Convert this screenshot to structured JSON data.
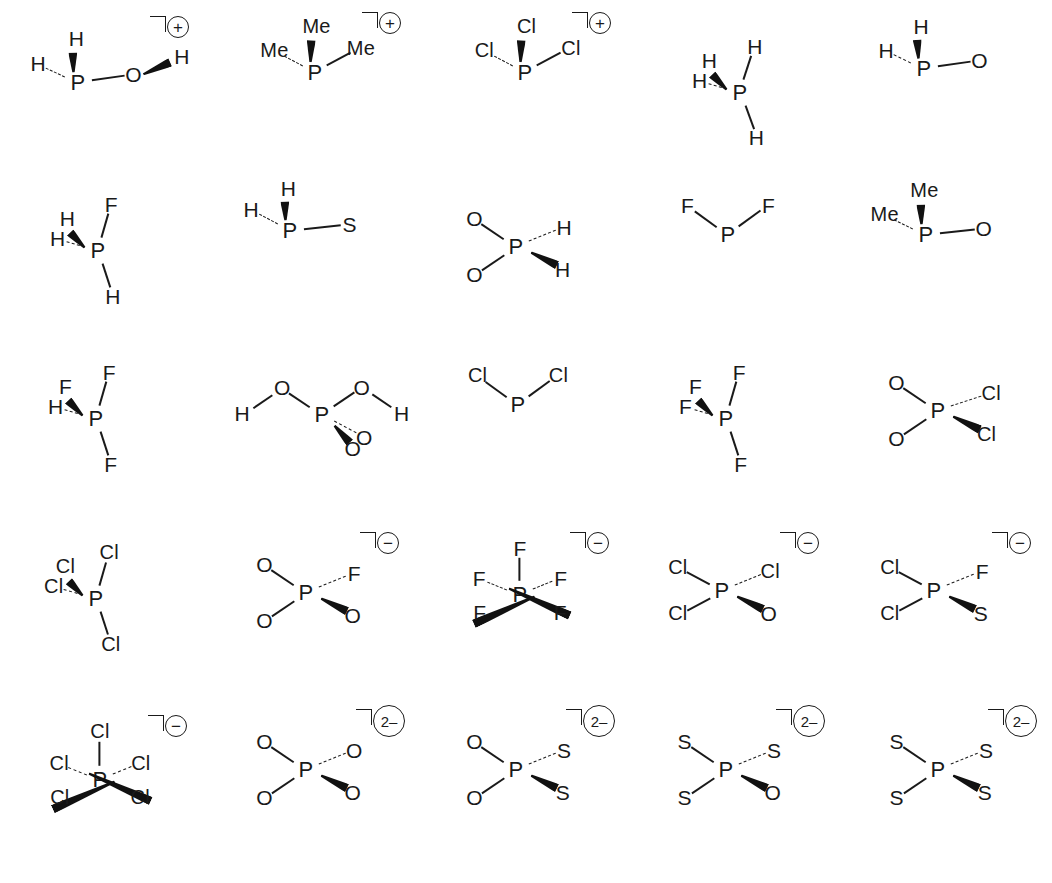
{
  "figure": {
    "columns": 5,
    "rows": 5,
    "background_color": "#ffffff",
    "ink_color": "#1a1a1a"
  },
  "bond_styles": {
    "plain": "plain-line",
    "wedge": "bold-wedge",
    "dash": "hashed-dash"
  },
  "charges": {
    "plus": "+",
    "minus": "−",
    "two_minus": "2–"
  },
  "structures": [
    {
      "id": "s1",
      "center": "P",
      "charge": "+",
      "charge_style": "circle-small",
      "col": 0,
      "row": 0,
      "substituents": [
        {
          "label": "H",
          "bond": "dash"
        },
        {
          "label": "H",
          "bond": "wedge"
        },
        {
          "label": "O",
          "bond": "plain"
        },
        {
          "label": "H",
          "bond": "wedge"
        }
      ]
    },
    {
      "id": "s2",
      "center": "P",
      "charge": "+",
      "charge_style": "circle-small",
      "col": 1,
      "row": 0,
      "substituents": [
        {
          "label": "Me",
          "bond": "dash"
        },
        {
          "label": "Me",
          "bond": "wedge"
        },
        {
          "label": "Me",
          "bond": "plain"
        }
      ]
    },
    {
      "id": "s3",
      "center": "P",
      "charge": "+",
      "charge_style": "circle-small",
      "col": 2,
      "row": 0,
      "substituents": [
        {
          "label": "Cl",
          "bond": "dash"
        },
        {
          "label": "Cl",
          "bond": "wedge"
        },
        {
          "label": "Cl",
          "bond": "plain"
        }
      ]
    },
    {
      "id": "s4",
      "center": "P",
      "charge": "",
      "charge_style": "none",
      "col": 3,
      "row": 0,
      "substituents": [
        {
          "label": "H",
          "bond": "plain"
        },
        {
          "label": "H",
          "bond": "dash"
        },
        {
          "label": "H",
          "bond": "wedge"
        },
        {
          "label": "H",
          "bond": "plain"
        }
      ]
    },
    {
      "id": "s5",
      "center": "P",
      "charge": "",
      "charge_style": "none",
      "col": 4,
      "row": 0,
      "substituents": [
        {
          "label": "H",
          "bond": "dash"
        },
        {
          "label": "H",
          "bond": "wedge"
        },
        {
          "label": "O",
          "bond": "plain"
        }
      ]
    },
    {
      "id": "s6",
      "center": "P",
      "charge": "",
      "charge_style": "none",
      "col": 0,
      "row": 1,
      "substituents": [
        {
          "label": "F",
          "bond": "plain"
        },
        {
          "label": "H",
          "bond": "dash"
        },
        {
          "label": "H",
          "bond": "wedge"
        },
        {
          "label": "H",
          "bond": "plain"
        }
      ]
    },
    {
      "id": "s7",
      "center": "P",
      "charge": "",
      "charge_style": "none",
      "col": 1,
      "row": 1,
      "substituents": [
        {
          "label": "H",
          "bond": "dash"
        },
        {
          "label": "H",
          "bond": "wedge"
        },
        {
          "label": "S",
          "bond": "plain"
        }
      ]
    },
    {
      "id": "s8",
      "center": "P",
      "charge": "",
      "charge_style": "none",
      "col": 2,
      "row": 1,
      "substituents": [
        {
          "label": "O",
          "bond": "plain"
        },
        {
          "label": "O",
          "bond": "plain"
        },
        {
          "label": "H",
          "bond": "dash"
        },
        {
          "label": "H",
          "bond": "wedge"
        }
      ]
    },
    {
      "id": "s9",
      "center": "P",
      "charge": "",
      "charge_style": "none",
      "col": 3,
      "row": 1,
      "substituents": [
        {
          "label": "F",
          "bond": "plain"
        },
        {
          "label": "F",
          "bond": "plain"
        }
      ]
    },
    {
      "id": "s10",
      "center": "P",
      "charge": "",
      "charge_style": "none",
      "col": 4,
      "row": 1,
      "substituents": [
        {
          "label": "Me",
          "bond": "dash"
        },
        {
          "label": "Me",
          "bond": "wedge"
        },
        {
          "label": "O",
          "bond": "plain"
        }
      ]
    },
    {
      "id": "s11",
      "center": "P",
      "charge": "",
      "charge_style": "none",
      "col": 0,
      "row": 2,
      "substituents": [
        {
          "label": "F",
          "bond": "plain"
        },
        {
          "label": "H",
          "bond": "dash"
        },
        {
          "label": "F",
          "bond": "wedge"
        },
        {
          "label": "F",
          "bond": "plain"
        }
      ]
    },
    {
      "id": "s12",
      "center": "P",
      "charge": "",
      "charge_style": "none",
      "col": 1,
      "row": 2,
      "substituents": [
        {
          "label": "O",
          "bond": "plain",
          "terminal": "H"
        },
        {
          "label": "O",
          "bond": "plain",
          "terminal": "H"
        },
        {
          "label": "O",
          "bond": "wedge"
        },
        {
          "label": "O",
          "bond": "dash"
        }
      ]
    },
    {
      "id": "s13",
      "center": "P",
      "charge": "",
      "charge_style": "none",
      "col": 2,
      "row": 2,
      "substituents": [
        {
          "label": "Cl",
          "bond": "plain"
        },
        {
          "label": "Cl",
          "bond": "plain"
        }
      ]
    },
    {
      "id": "s14",
      "center": "P",
      "charge": "",
      "charge_style": "none",
      "col": 3,
      "row": 2,
      "substituents": [
        {
          "label": "F",
          "bond": "plain"
        },
        {
          "label": "F",
          "bond": "dash"
        },
        {
          "label": "F",
          "bond": "wedge"
        },
        {
          "label": "F",
          "bond": "plain"
        }
      ]
    },
    {
      "id": "s15",
      "center": "P",
      "charge": "",
      "charge_style": "none",
      "col": 4,
      "row": 2,
      "substituents": [
        {
          "label": "O",
          "bond": "plain"
        },
        {
          "label": "O",
          "bond": "plain"
        },
        {
          "label": "Cl",
          "bond": "dash"
        },
        {
          "label": "Cl",
          "bond": "wedge"
        }
      ]
    },
    {
      "id": "s16",
      "center": "P",
      "charge": "",
      "charge_style": "none",
      "col": 0,
      "row": 3,
      "substituents": [
        {
          "label": "Cl",
          "bond": "plain"
        },
        {
          "label": "Cl",
          "bond": "dash"
        },
        {
          "label": "Cl",
          "bond": "wedge"
        },
        {
          "label": "Cl",
          "bond": "plain"
        }
      ]
    },
    {
      "id": "s17",
      "center": "P",
      "charge": "−",
      "charge_style": "circle-small",
      "col": 1,
      "row": 3,
      "substituents": [
        {
          "label": "O",
          "bond": "plain"
        },
        {
          "label": "O",
          "bond": "plain"
        },
        {
          "label": "F",
          "bond": "dash"
        },
        {
          "label": "O",
          "bond": "wedge"
        }
      ]
    },
    {
      "id": "s18",
      "center": "P",
      "charge": "−",
      "charge_style": "circle-small",
      "col": 2,
      "row": 3,
      "substituents": [
        {
          "label": "F",
          "bond": "plain"
        },
        {
          "label": "F",
          "bond": "dash"
        },
        {
          "label": "F",
          "bond": "dash"
        },
        {
          "label": "F",
          "bond": "wedge"
        },
        {
          "label": "F",
          "bond": "wedge"
        }
      ]
    },
    {
      "id": "s19",
      "center": "P",
      "charge": "−",
      "charge_style": "circle-small",
      "col": 3,
      "row": 3,
      "substituents": [
        {
          "label": "Cl",
          "bond": "plain"
        },
        {
          "label": "Cl",
          "bond": "plain"
        },
        {
          "label": "Cl",
          "bond": "dash"
        },
        {
          "label": "O",
          "bond": "wedge"
        }
      ]
    },
    {
      "id": "s20",
      "center": "P",
      "charge": "−",
      "charge_style": "circle-small",
      "col": 4,
      "row": 3,
      "substituents": [
        {
          "label": "Cl",
          "bond": "plain"
        },
        {
          "label": "Cl",
          "bond": "plain"
        },
        {
          "label": "F",
          "bond": "dash"
        },
        {
          "label": "S",
          "bond": "wedge"
        }
      ]
    },
    {
      "id": "s21",
      "center": "P",
      "charge": "−",
      "charge_style": "circle-small",
      "col": 0,
      "row": 4,
      "substituents": [
        {
          "label": "Cl",
          "bond": "plain"
        },
        {
          "label": "Cl",
          "bond": "dash"
        },
        {
          "label": "Cl",
          "bond": "dash"
        },
        {
          "label": "Cl",
          "bond": "wedge"
        },
        {
          "label": "Cl",
          "bond": "wedge"
        }
      ]
    },
    {
      "id": "s22",
      "center": "P",
      "charge": "2–",
      "charge_style": "circle-large",
      "col": 1,
      "row": 4,
      "substituents": [
        {
          "label": "O",
          "bond": "plain"
        },
        {
          "label": "O",
          "bond": "plain"
        },
        {
          "label": "O",
          "bond": "dash"
        },
        {
          "label": "O",
          "bond": "wedge"
        }
      ]
    },
    {
      "id": "s23",
      "center": "P",
      "charge": "2–",
      "charge_style": "circle-large",
      "col": 2,
      "row": 4,
      "substituents": [
        {
          "label": "O",
          "bond": "plain"
        },
        {
          "label": "O",
          "bond": "plain"
        },
        {
          "label": "S",
          "bond": "dash"
        },
        {
          "label": "S",
          "bond": "wedge"
        }
      ]
    },
    {
      "id": "s24",
      "center": "P",
      "charge": "2–",
      "charge_style": "circle-large",
      "col": 3,
      "row": 4,
      "substituents": [
        {
          "label": "S",
          "bond": "plain"
        },
        {
          "label": "S",
          "bond": "plain"
        },
        {
          "label": "S",
          "bond": "dash"
        },
        {
          "label": "O",
          "bond": "wedge"
        }
      ]
    },
    {
      "id": "s25",
      "center": "P",
      "charge": "2–",
      "charge_style": "circle-large",
      "col": 4,
      "row": 4,
      "substituents": [
        {
          "label": "S",
          "bond": "plain"
        },
        {
          "label": "S",
          "bond": "plain"
        },
        {
          "label": "S",
          "bond": "dash"
        },
        {
          "label": "S",
          "bond": "wedge"
        }
      ]
    }
  ]
}
